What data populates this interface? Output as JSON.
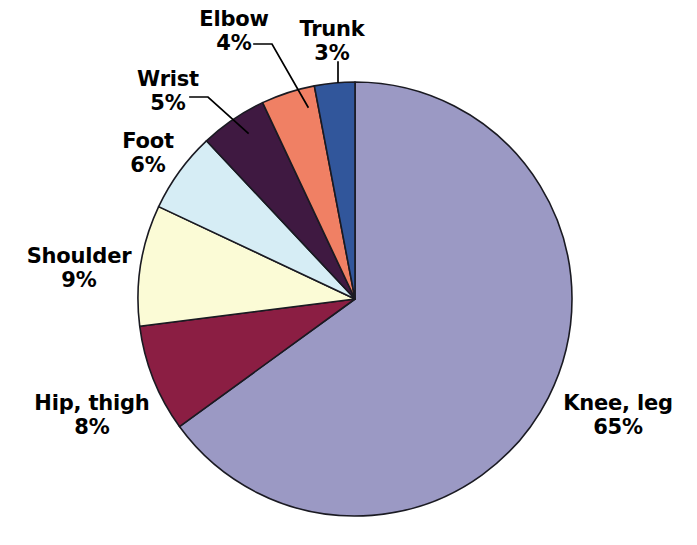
{
  "chart_data": {
    "type": "pie",
    "title": "",
    "subtitle": "",
    "xlabel": "",
    "ylabel": "",
    "legend": "none",
    "grid": false,
    "labels_position": "outside-with-leader-lines",
    "start_angle_deg": 0,
    "direction": "clockwise",
    "categories": [
      "Knee, leg",
      "Hip, thigh",
      "Shoulder",
      "Foot",
      "Wrist",
      "Elbow",
      "Trunk"
    ],
    "values": [
      65,
      8,
      9,
      6,
      5,
      4,
      3
    ],
    "value_unit": "%",
    "colors": [
      "#9b99c4",
      "#8b1e43",
      "#fbfbd6",
      "#d6edf5",
      "#3f1941",
      "#f08064",
      "#31569b"
    ],
    "slices": [
      {
        "label": "Knee, leg",
        "value": 65,
        "value_text": "65%",
        "color": "#9b99c4",
        "label_placement": "right"
      },
      {
        "label": "Hip, thigh",
        "value": 8,
        "value_text": "8%",
        "color": "#8b1e43",
        "label_placement": "lower-left"
      },
      {
        "label": "Shoulder",
        "value": 9,
        "value_text": "9%",
        "color": "#fbfbd6",
        "label_placement": "left"
      },
      {
        "label": "Foot",
        "value": 6,
        "value_text": "6%",
        "color": "#d6edf5",
        "label_placement": "upper-left"
      },
      {
        "label": "Wrist",
        "value": 5,
        "value_text": "5%",
        "color": "#3f1941",
        "label_placement": "upper-left"
      },
      {
        "label": "Elbow",
        "value": 4,
        "value_text": "4%",
        "color": "#f08064",
        "label_placement": "top"
      },
      {
        "label": "Trunk",
        "value": 3,
        "value_text": "3%",
        "color": "#31569b",
        "label_placement": "top-right"
      }
    ]
  },
  "labels": {
    "knee": {
      "name": "Knee, leg",
      "value": "65%"
    },
    "hip": {
      "name": "Hip, thigh",
      "value": "8%"
    },
    "shoulder": {
      "name": "Shoulder",
      "value": "9%"
    },
    "foot": {
      "name": "Foot",
      "value": "6%"
    },
    "wrist": {
      "name": "Wrist",
      "value": "5%"
    },
    "elbow": {
      "name": "Elbow",
      "value": "4%"
    },
    "trunk": {
      "name": "Trunk",
      "value": "3%"
    }
  },
  "style": {
    "background": "#ffffff",
    "outline": "#1a1a22",
    "text": "#000000"
  }
}
